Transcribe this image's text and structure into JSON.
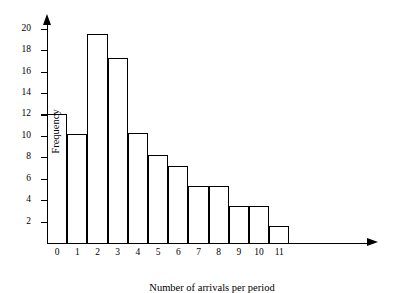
{
  "chart_data": {
    "type": "bar",
    "title": "",
    "xlabel": "Number of arrivals per period",
    "ylabel": "Frequency",
    "x_axis_variable": "x",
    "categories": [
      "0",
      "1",
      "2",
      "3",
      "4",
      "5",
      "6",
      "7",
      "8",
      "9",
      "10",
      "11"
    ],
    "values": [
      12.0,
      10.2,
      19.5,
      17.3,
      10.3,
      8.2,
      7.2,
      5.3,
      5.3,
      3.5,
      3.5,
      1.6
    ],
    "ylim": [
      0,
      21
    ],
    "xlim": [
      0,
      12
    ],
    "y_ticks": [
      2,
      4,
      6,
      8,
      10,
      12,
      14,
      16,
      18,
      20
    ],
    "y_tick_labels": [
      "2",
      "4",
      "6",
      "8",
      "10",
      "12",
      "14",
      "16",
      "18",
      "20"
    ],
    "grid": false,
    "legend": false,
    "legend_position": "none",
    "bar_fill_color": "#ffffff",
    "bar_edge_color": "#000000",
    "axis_color": "#000000",
    "background_color": "#ffffff"
  }
}
